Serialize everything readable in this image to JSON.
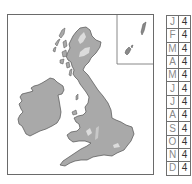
{
  "map": {
    "region": "British Isles",
    "fill_color": "#a9a9a9",
    "highlight_color": "#dcdcdc",
    "outline_color": "#505050",
    "frame_color": "#6a6a6a",
    "inset": "Shetland and Orkney islands"
  },
  "legend": {
    "rows": [
      {
        "month": "J",
        "value": "4"
      },
      {
        "month": "F",
        "value": "4"
      },
      {
        "month": "M",
        "value": "4"
      },
      {
        "month": "A",
        "value": "4"
      },
      {
        "month": "M",
        "value": "4"
      },
      {
        "month": "J",
        "value": "4"
      },
      {
        "month": "J",
        "value": "4"
      },
      {
        "month": "A",
        "value": "4"
      },
      {
        "month": "S",
        "value": "4"
      },
      {
        "month": "O",
        "value": "4"
      },
      {
        "month": "N",
        "value": "4"
      },
      {
        "month": "D",
        "value": "4"
      }
    ]
  }
}
